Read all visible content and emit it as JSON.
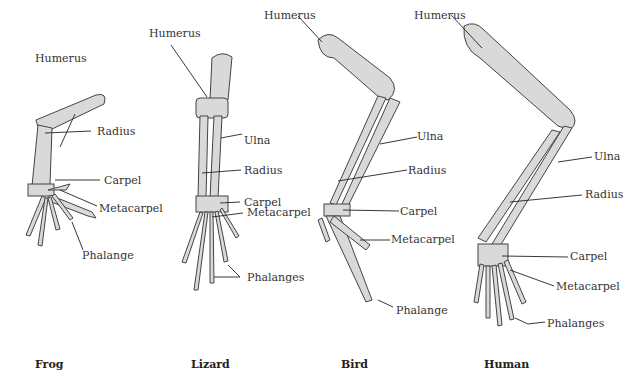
{
  "figure": {
    "limbs": [
      {
        "animal": "Frog",
        "labels": [
          "Humerus",
          "Radius",
          "Carpel",
          "Metacarpel",
          "Phalange"
        ]
      },
      {
        "animal": "Lizard",
        "labels": [
          "Humerus",
          "Ulna",
          "Radius",
          "Carpel",
          "Metacarpel",
          "Phalanges"
        ]
      },
      {
        "animal": "Bird",
        "labels": [
          "Humerus",
          "Ulna",
          "Radius",
          "Carpel",
          "Metacarpel",
          "Phalange"
        ]
      },
      {
        "animal": "Human",
        "labels": [
          "Humerus",
          "Ulna",
          "Radius",
          "Carpel",
          "Metacarpel",
          "Phalanges"
        ]
      }
    ]
  },
  "colors": {
    "bone_fill": "#d9d9d9",
    "outline": "#444444",
    "background": "#ffffff"
  }
}
